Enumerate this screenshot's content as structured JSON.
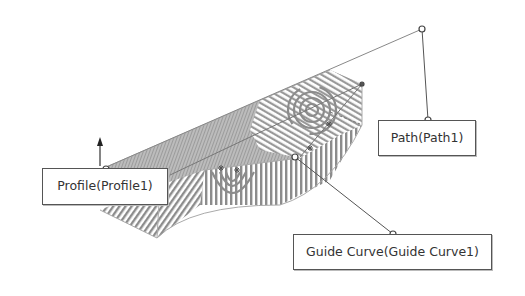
{
  "diagram": {
    "type": "swept-surface-callouts",
    "colors": {
      "background": "#ffffff",
      "callout_border": "#555555",
      "callout_text": "#333333",
      "leader_line": "#555555",
      "surface_stripe": "#8c8c8c",
      "surface_edge": "#aaaaaa"
    },
    "callouts": {
      "profile": {
        "label": "Profile(Profile1)"
      },
      "path": {
        "label": "Path(Path1)"
      },
      "guide_curve": {
        "label": "Guide Curve(Guide Curve1)"
      }
    },
    "icons": {
      "profile_direction_arrow": "up-arrow-icon",
      "anchor_points": "circle-handle-icon"
    }
  }
}
